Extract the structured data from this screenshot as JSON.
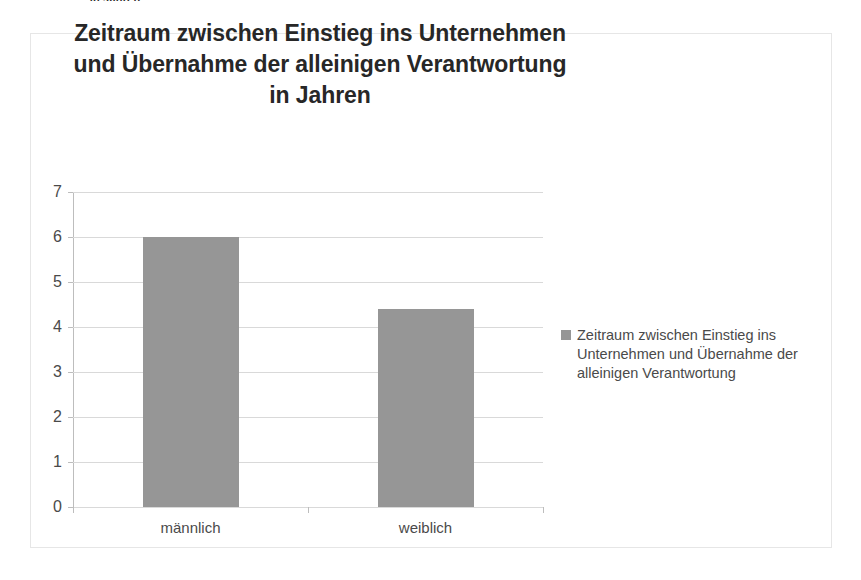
{
  "page_fragment": "in Jahren",
  "chart": {
    "title_lines": [
      "Zeitraum zwischen Einstieg ins Unternehmen",
      "und Übernahme der alleinigen Verantwortung",
      "in Jahren"
    ],
    "legend": {
      "marker": "legend-color-swatch",
      "label": "Zeitraum zwischen Einstieg ins Unternehmen und Übernahme der alleinigen Verantwortung"
    }
  },
  "chart_data": {
    "type": "bar",
    "title": "Zeitraum zwischen Einstieg ins Unternehmen und Übernahme der alleinigen Verantwortung in Jahren",
    "categories": [
      "männlich",
      "weiblich"
    ],
    "series": [
      {
        "name": "Zeitraum zwischen Einstieg ins Unternehmen und Übernahme der alleinigen Verantwortung",
        "values": [
          6.0,
          4.4
        ],
        "color": "#969696"
      }
    ],
    "xlabel": "",
    "ylabel": "",
    "ylim": [
      0,
      7
    ],
    "ytick_labels": [
      "0",
      "1",
      "2",
      "3",
      "4",
      "5",
      "6",
      "7"
    ],
    "ytick_values": [
      0,
      1,
      2,
      3,
      4,
      5,
      6,
      7
    ],
    "grid": true,
    "grid_color": "#d9d9d9",
    "legend_position": "right",
    "background": "#ffffff",
    "frame_color": "#e6e6e6"
  }
}
